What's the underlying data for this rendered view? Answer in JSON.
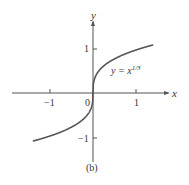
{
  "chart_data": {
    "type": "line",
    "title": "",
    "equation": "y = x^{1/3}",
    "series": [
      {
        "name": "y = x^(1/3)",
        "x": [
          -1.4,
          -1,
          -0.5,
          -0.125,
          0,
          0.125,
          0.5,
          1,
          1.4
        ],
        "y": [
          -1.119,
          -1,
          -0.794,
          -0.5,
          0,
          0.5,
          0.794,
          1,
          1.119
        ]
      }
    ],
    "xlabel": "x",
    "ylabel": "y",
    "x_ticks": [
      "-1",
      "1"
    ],
    "y_ticks": [
      "1",
      "-1"
    ],
    "origin_label": "0",
    "xlim": [
      -1.8,
      1.8
    ],
    "ylim": [
      -1.6,
      1.6
    ],
    "grid": false,
    "legend": "none"
  },
  "labels": {
    "x_axis": "x",
    "y_axis": "y",
    "origin": "0",
    "tick_x_neg": "−1",
    "tick_x_pos": "1",
    "tick_y_pos": "1",
    "tick_y_neg": "−1",
    "curve_label_base": "y = x",
    "curve_label_exp": "1/3",
    "caption": "(b)"
  }
}
